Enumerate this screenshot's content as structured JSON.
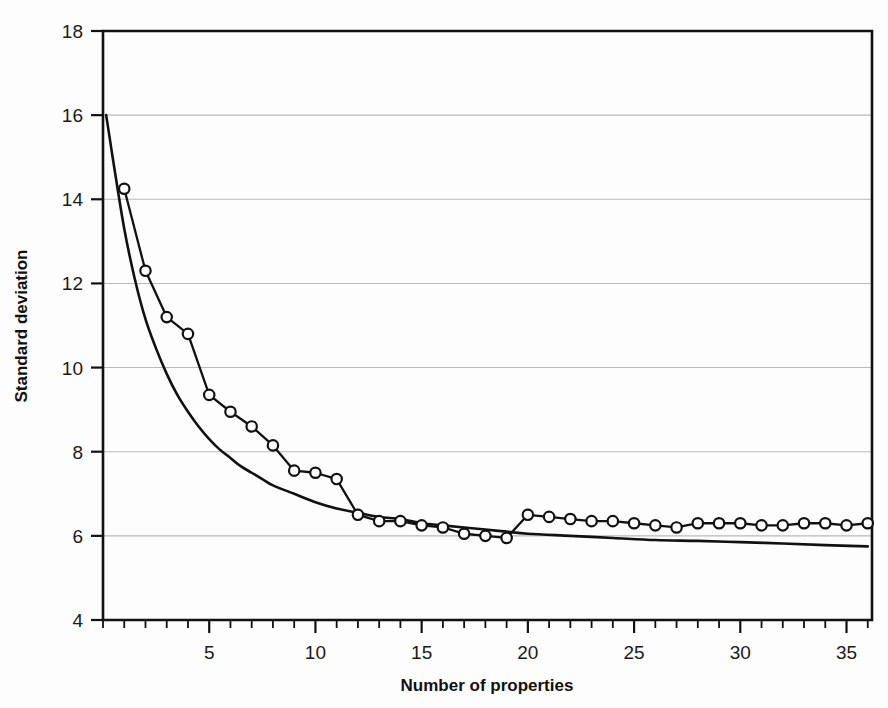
{
  "figure": {
    "background_color": "#fdfdfd",
    "ink_color": "#111111",
    "grid_color": "#b9b9b9"
  },
  "axis": {
    "xlabel": "Number of properties",
    "ylabel": "Standard deviation",
    "x_tick_labels": [
      "5",
      "10",
      "15",
      "20",
      "25",
      "30",
      "35"
    ],
    "y_tick_labels": [
      "4",
      "6",
      "8",
      "10",
      "12",
      "14",
      "16",
      "18"
    ]
  },
  "chart_data": {
    "type": "line",
    "title": "",
    "subtitle": "",
    "xlabel": "Number of properties",
    "ylabel": "Standard deviation",
    "xlim": [
      0,
      36.2
    ],
    "ylim": [
      4,
      18
    ],
    "x_ticks": [
      5,
      10,
      15,
      20,
      25,
      30,
      35
    ],
    "x_minor_tick_step": 1,
    "y_ticks": [
      4,
      6,
      8,
      10,
      12,
      14,
      16,
      18
    ],
    "grid": "horizontal",
    "legend": "none",
    "annotations": [],
    "series": [
      {
        "name": "Observed standard deviation",
        "marker": "open-circle",
        "line_style": "solid",
        "x": [
          1,
          2,
          3,
          4,
          5,
          6,
          7,
          8,
          9,
          10,
          11,
          12,
          13,
          14,
          15,
          16,
          17,
          18,
          19,
          20,
          21,
          22,
          23,
          24,
          25,
          26,
          27,
          28,
          29,
          30,
          31,
          32,
          33,
          34,
          35,
          36
        ],
        "values": [
          14.25,
          12.3,
          11.2,
          10.8,
          9.35,
          8.95,
          8.6,
          8.15,
          7.55,
          7.5,
          7.35,
          6.5,
          6.35,
          6.35,
          6.25,
          6.2,
          6.05,
          6.0,
          5.95,
          6.5,
          6.45,
          6.4,
          6.35,
          6.35,
          6.3,
          6.25,
          6.2,
          6.3,
          6.3,
          6.3,
          6.25,
          6.25,
          6.3,
          6.3,
          6.25,
          6.3
        ]
      },
      {
        "name": "Fitted smooth curve",
        "marker": "none",
        "line_style": "solid",
        "x": [
          0.15,
          0.5,
          1,
          1.5,
          2,
          2.5,
          3,
          3.5,
          4,
          4.5,
          5,
          5.5,
          6,
          6.5,
          7,
          7.5,
          8,
          9,
          10,
          11,
          12,
          13,
          14,
          15,
          16,
          17,
          18,
          19,
          20,
          22,
          24,
          26,
          28,
          30,
          32,
          34,
          36
        ],
        "values": [
          16.0,
          14.85,
          13.3,
          12.1,
          11.15,
          10.45,
          9.85,
          9.35,
          8.95,
          8.6,
          8.3,
          8.05,
          7.85,
          7.65,
          7.5,
          7.35,
          7.2,
          7.0,
          6.8,
          6.65,
          6.55,
          6.45,
          6.4,
          6.3,
          6.25,
          6.2,
          6.15,
          6.1,
          6.05,
          6.0,
          5.95,
          5.9,
          5.88,
          5.85,
          5.82,
          5.78,
          5.75
        ]
      }
    ]
  }
}
